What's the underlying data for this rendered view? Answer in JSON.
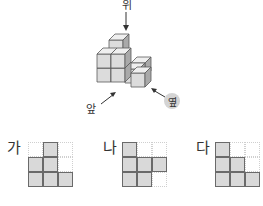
{
  "directions": {
    "top": "위",
    "front": "앞",
    "side": "옆"
  },
  "colors": {
    "cube_front": "#dcdcdc",
    "cube_top": "#efefef",
    "cube_side": "#a9a9a9",
    "filled_cell": "#d9d9d9",
    "grid_line": "#cfcfcf",
    "outline": "#5a5a5a"
  },
  "options": [
    {
      "label": "가",
      "cells": [
        [
          0,
          1,
          0
        ],
        [
          1,
          1,
          0
        ],
        [
          1,
          1,
          1
        ]
      ]
    },
    {
      "label": "나",
      "cells": [
        [
          1,
          0,
          0
        ],
        [
          1,
          1,
          1
        ],
        [
          1,
          1,
          0
        ]
      ]
    },
    {
      "label": "다",
      "cells": [
        [
          1,
          0,
          0
        ],
        [
          1,
          1,
          0
        ],
        [
          1,
          1,
          1
        ]
      ]
    }
  ]
}
